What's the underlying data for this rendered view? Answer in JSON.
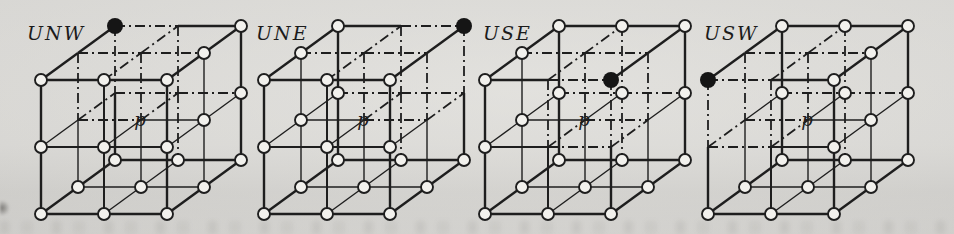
{
  "figure": {
    "center_label": "p",
    "axes": {
      "i": "west to east",
      "j": "up to down",
      "k": "south(front) to north(back)"
    },
    "cubes": [
      {
        "label": "UNW",
        "filled_vertex": "up-north-west",
        "filled_ijk": [
          0,
          0,
          2
        ]
      },
      {
        "label": "UNE",
        "filled_vertex": "up-north-east",
        "filled_ijk": [
          2,
          0,
          2
        ]
      },
      {
        "label": "USE",
        "filled_vertex": "up-south-east",
        "filled_ijk": [
          2,
          0,
          0
        ]
      },
      {
        "label": "USW",
        "filled_vertex": "up-south-west",
        "filled_ijk": [
          0,
          0,
          0
        ]
      }
    ],
    "colors": {
      "paper": "#d5d4d1",
      "ink": "#1e1e1e",
      "node_fill": "#f2f1ed",
      "filled_node": "#151515"
    }
  }
}
